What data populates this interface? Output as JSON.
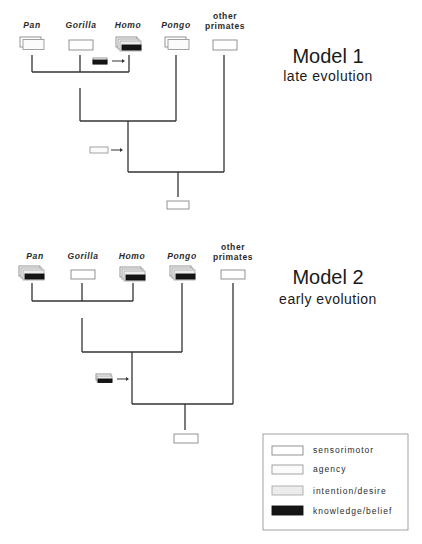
{
  "models": [
    {
      "title": "Model 1",
      "subtitle": "late evolution",
      "taxa": [
        {
          "name": "Pan",
          "italic": true,
          "capacities": [
            "sensorimotor",
            "agency"
          ]
        },
        {
          "name": "Gorilla",
          "italic": true,
          "capacities": [
            "sensorimotor"
          ]
        },
        {
          "name": "Homo",
          "italic": true,
          "capacities": [
            "sensorimotor",
            "agency",
            "intention/desire",
            "knowledge/belief"
          ]
        },
        {
          "name": "Pongo",
          "italic": true,
          "capacities": [
            "sensorimotor",
            "agency"
          ]
        },
        {
          "name_line1": "other",
          "name_line2": "primates",
          "italic": false,
          "capacities": [
            "sensorimotor"
          ]
        }
      ],
      "branch_gain_1": {
        "capacity": "knowledge/belief",
        "target": "Homo"
      },
      "branch_gain_2": {
        "capacity": "agency",
        "target": "great apes ancestor"
      },
      "root": {
        "capacity": "sensorimotor"
      }
    },
    {
      "title": "Model 2",
      "subtitle": "early evolution",
      "taxa": [
        {
          "name": "Pan",
          "italic": true,
          "capacities": [
            "sensorimotor",
            "agency",
            "intention/desire",
            "knowledge/belief"
          ]
        },
        {
          "name": "Gorilla",
          "italic": true,
          "capacities": [
            "sensorimotor"
          ]
        },
        {
          "name": "Homo",
          "italic": true,
          "capacities": [
            "sensorimotor",
            "agency",
            "intention/desire",
            "knowledge/belief"
          ]
        },
        {
          "name": "Pongo",
          "italic": true,
          "capacities": [
            "sensorimotor",
            "agency",
            "intention/desire",
            "knowledge/belief"
          ]
        },
        {
          "name_line1": "other",
          "name_line2": "primates",
          "italic": false,
          "capacities": [
            "sensorimotor"
          ]
        }
      ],
      "branch_gain": {
        "capacity": "agency + intention/desire + knowledge/belief",
        "target": "great apes ancestor"
      },
      "root": {
        "capacity": "sensorimotor"
      }
    }
  ],
  "legend": {
    "items": [
      {
        "label": "sensorimotor",
        "color": "#ffffff"
      },
      {
        "label": "agency",
        "color": "#fbfbfb"
      },
      {
        "label": "intention/desire",
        "color": "#ececec"
      },
      {
        "label": "knowledge/belief",
        "color": "#151515"
      }
    ]
  },
  "colors": {
    "line": "#333333",
    "box_border": "#888888",
    "knowledge": "#151515",
    "intention": "#ececec"
  }
}
